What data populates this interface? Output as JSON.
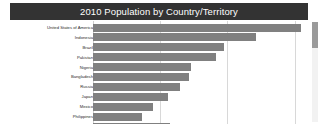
{
  "title": {
    "text": "2010 Population by Country/Territory",
    "background_color": "#333333",
    "text_color": "#ffffff"
  },
  "scrollbar": {
    "orientation": "vertical",
    "thumb_position": "top",
    "track_color": "#f2f2f2",
    "thumb_color": "#9a9a9a"
  },
  "chart_data": {
    "type": "bar",
    "orientation": "horizontal",
    "title": "2010 Population by Country/Territory",
    "xlabel": "",
    "ylabel": "",
    "bar_color": "#808080",
    "grid": true,
    "grid_axis": "x",
    "legend": "none",
    "xlim": [
      0,
      320
    ],
    "xticks": [
      0,
      100,
      200,
      300
    ],
    "xtick_labels": [
      "",
      "",
      "",
      ""
    ],
    "units": "millions of people",
    "sorted": "descending",
    "truncated": true,
    "truncation_note": "An 11th bar is partially visible at the bottom edge; list continues below the viewport.",
    "categories": [
      "United States of America",
      "Indonesia",
      "Brazil",
      "Pakistan",
      "Nigeria",
      "Bangladesh",
      "Russia",
      "Japan",
      "Mexico",
      "Philippines"
    ],
    "values": [
      310,
      243,
      195,
      183,
      146,
      143,
      130,
      112,
      90,
      73
    ],
    "partial_row": {
      "label": "",
      "value": 115
    }
  }
}
